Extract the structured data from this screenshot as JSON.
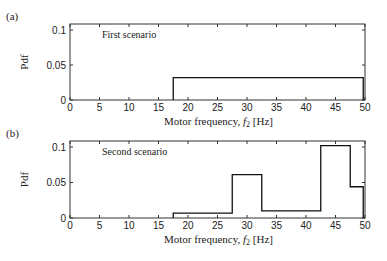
{
  "chart_data": [
    {
      "type": "line",
      "step": true,
      "panel_label": "(a)",
      "annotation": "First scenario",
      "xlabel": "Motor frequency, f2 [Hz]",
      "ylabel": "Pdf",
      "xlim": [
        0,
        50
      ],
      "ylim": [
        0,
        0.11
      ],
      "xticks": [
        0,
        5,
        10,
        15,
        20,
        25,
        30,
        35,
        40,
        45,
        50
      ],
      "yticks": [
        0,
        0.05,
        0.1
      ],
      "ytick_labels": [
        "0",
        "0.05",
        "0.1"
      ],
      "grid": false,
      "series": [
        {
          "name": "pdf",
          "segments": [
            {
              "x0": 17.5,
              "x1": 49.7,
              "y": 0.032
            }
          ]
        }
      ]
    },
    {
      "type": "line",
      "step": true,
      "panel_label": "(b)",
      "annotation": "Second scenario",
      "xlabel": "Motor frequency, f2 [Hz]",
      "ylabel": "Pdf",
      "xlim": [
        0,
        50
      ],
      "ylim": [
        0,
        0.11
      ],
      "xticks": [
        0,
        5,
        10,
        15,
        20,
        25,
        30,
        35,
        40,
        45,
        50
      ],
      "yticks": [
        0,
        0.05,
        0.1
      ],
      "ytick_labels": [
        "0",
        "0.05",
        "0.1"
      ],
      "grid": false,
      "series": [
        {
          "name": "pdf",
          "segments": [
            {
              "x0": 17.5,
              "x1": 27.5,
              "y": 0.007
            },
            {
              "x0": 27.5,
              "x1": 32.5,
              "y": 0.061
            },
            {
              "x0": 32.5,
              "x1": 42.5,
              "y": 0.01
            },
            {
              "x0": 42.5,
              "x1": 47.5,
              "y": 0.102
            },
            {
              "x0": 47.5,
              "x1": 49.7,
              "y": 0.044
            }
          ]
        }
      ]
    }
  ],
  "xlabel_parts": {
    "main": "Motor frequency, ",
    "var": "f",
    "sub": "2",
    "unit": " [Hz]"
  },
  "colors": {
    "axis": "#333333",
    "line": "#111111"
  }
}
